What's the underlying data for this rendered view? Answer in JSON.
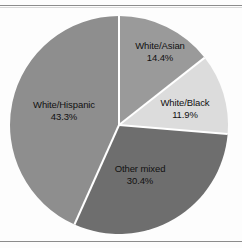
{
  "chart_data": {
    "type": "pie",
    "title": "",
    "subtitle": "",
    "xlabel": "",
    "ylabel": "",
    "legend_position": "none",
    "grid": false,
    "label_format": "category name above percentage",
    "start_angle_deg": 0,
    "direction": "clockwise",
    "categories": [
      "White/Asian",
      "White/Black",
      "Other mixed",
      "White/Hispanic"
    ],
    "values": [
      14.4,
      11.9,
      30.4,
      43.3
    ],
    "unit": "%",
    "slices": [
      {
        "label": "White/Asian",
        "percent_text": "14.4%",
        "value": 14.4,
        "color": "#9a9a9a",
        "label_inside": true
      },
      {
        "label": "White/Black",
        "percent_text": "11.9%",
        "value": 11.9,
        "color": "#dcdcdc",
        "label_inside": true
      },
      {
        "label": "Other mixed",
        "percent_text": "30.4%",
        "value": 30.4,
        "color": "#6e6e6e",
        "label_inside": true
      },
      {
        "label": "White/Hispanic",
        "percent_text": "43.3%",
        "value": 43.3,
        "color": "#8e8e8e",
        "label_inside": true
      }
    ]
  },
  "figure": {
    "background_color": "#fdfdfd",
    "separator_color": "#ffffff",
    "rule_color": "#8c8c8c",
    "label_color": "#111111"
  }
}
